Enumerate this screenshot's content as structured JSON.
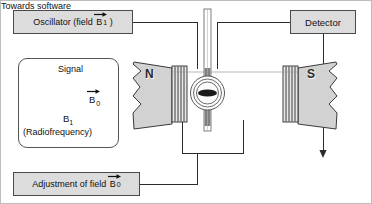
{
  "diagram": {
    "type": "instrument-block-diagram"
  },
  "blocks": {
    "oscillator": {
      "text_before": "Oscillator (field",
      "symbol": "B",
      "subscript": "1",
      "text_after": ")",
      "vector": true
    },
    "adjustment": {
      "text_before": "Adjustment of field",
      "symbol": "B",
      "subscript": "0",
      "text_after": "",
      "vector": true
    },
    "detector": {
      "label": "Detector"
    }
  },
  "legend": {
    "signal_label": "Signal",
    "b0_symbol": "B",
    "b0_subscript": "0",
    "b1_symbol": "B",
    "b1_subscript": "1",
    "radiofrequency_label": "(Radiofrequency)"
  },
  "magnet": {
    "north_pole_label": "N",
    "south_pole_label": "S"
  },
  "output": {
    "towards_software_label": "Towards software"
  },
  "colors": {
    "box_fill": "#dcdcdc",
    "box_stroke": "#4a4a4a",
    "pole_fill": "#d2d2d2",
    "pole_stroke": "#3a3a3a",
    "coil_stroke": "#2b2b2b",
    "wire": "#2b2b2b",
    "sample_tube": "#8c8c8c",
    "background": "#ffffff"
  }
}
